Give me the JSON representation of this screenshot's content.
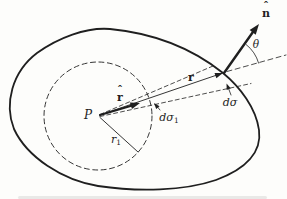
{
  "figure": {
    "background": "#fdfdfb",
    "ink": "#1f1f1f",
    "labels": {
      "point_p": "P",
      "r_hat": {
        "accent": "ˆ",
        "letter": "r"
      },
      "r_vector": "r",
      "n_hat": {
        "accent": "ˆ",
        "letter": "n"
      },
      "theta": "θ",
      "d_sigma_inner": {
        "main": "dσ",
        "sub": "1"
      },
      "d_sigma_outer": "dσ",
      "r_one": {
        "main": "r",
        "sub": "1"
      }
    }
  }
}
